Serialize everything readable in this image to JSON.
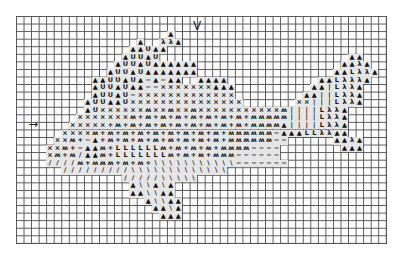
{
  "chart_data": {
    "type": "table",
    "grid": {
      "columns": 49,
      "rows": 30
    },
    "legend_symbols": {
      "A": "▲",
      "U": "U",
      "X": "×",
      "M": "ʍ",
      "P": "+",
      "L": "L",
      "D": "−",
      "S": "/",
      "K": "\\",
      "Y": "λ",
      "I": "|"
    },
    "rows": [
      "",
      "",
      "....................A",
      "................A..YYA",
      "...............AAUAA",
      "..............AUUAU.........................AA",
      ".............AUUAUAAAAAA...................AAYA",
      "............AUUAUAAAAAAA..................AALYYA",
      "..........AAUUAUADADAA..AAAA............AALYYYA",
      "..........AUUAUAADDXXXXXXXAAA..........AAILYYA",
      "..........AUUAUDXXXXXXXXXXXXX.........AAIILYYA",
      ".........AUUAAUXXXXXXXXXXXXXXX.......XXIIILYYA",
      ".........AUXXXXXXMXXMXXMXXXXXXXXXXXMIIIILYYA",
      "........XXXXXXXMPMPMPMPMPMPMPMPMMMMMIIIILYYA",
      ".......XXXXXPMPMPMPMPMPMPMPMPMPMMMMAIIIILYYA",
      "......XXXXMPMPMPMPMPMPMPMPMPMMMMMMDAAALLYYAA",
      ".....XXMPDAPMPMPMPMPMPMPMPMPMMMMMMDD......AAYA",
      "....XXMPDAAMPLLLLLLMPMPMPMPMMMMDDDD........AAA",
      "....XMPMSAAMPLLLLLLLMPMPMPMMMDDDDDD",
      "....SSSSMPMMMPMPMPKKKKKKKKKKKDDDDDDD",
      "......SSSSSSSSSKKKKKKKKKKKKK",
      "..............SSSSSKKKKK",
      "...............AKKAKA",
      "...............AAKKAA",
      ".................AKKAA",
      "..................AAKA",
      "...................AAA",
      "",
      "",
      ""
    ],
    "annotations": [
      {
        "symbol": "↓",
        "meaning": "vertical center marker",
        "col": 24,
        "row": 1
      },
      {
        "symbol": "→",
        "meaning": "horizontal center marker",
        "col": 2,
        "row": 14
      }
    ]
  },
  "markers": {
    "top": "V",
    "left": "→"
  }
}
